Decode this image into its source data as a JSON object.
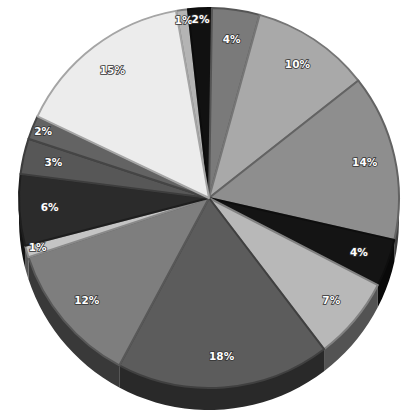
{
  "chart_data": {
    "type": "pie",
    "title": "",
    "style": "3d-tilted-grayscale",
    "start_angle_deg_clockwise_from_top": -10,
    "slices": [
      {
        "label": "1%",
        "value": 1,
        "color": "#b4b4b4"
      },
      {
        "label": "2%",
        "value": 2,
        "color": "#111111"
      },
      {
        "label": "4%",
        "value": 4,
        "color": "#7a7a7a"
      },
      {
        "label": "10%",
        "value": 10,
        "color": "#a9a9a9"
      },
      {
        "label": "14%",
        "value": 14,
        "color": "#8e8e8e"
      },
      {
        "label": "4%",
        "value": 4,
        "color": "#141414"
      },
      {
        "label": "7%",
        "value": 7,
        "color": "#b8b8b8"
      },
      {
        "label": "18%",
        "value": 18,
        "color": "#5c5c5c"
      },
      {
        "label": "12%",
        "value": 12,
        "color": "#7e7e7e"
      },
      {
        "label": "1%",
        "value": 1,
        "color": "#c4c4c4"
      },
      {
        "label": "6%",
        "value": 6,
        "color": "#2b2b2b"
      },
      {
        "label": "3%",
        "value": 3,
        "color": "#575757"
      },
      {
        "label": "2%",
        "value": 2,
        "color": "#636363"
      },
      {
        "label": "15%",
        "value": 15,
        "color": "#ececec"
      }
    ],
    "legend": "none",
    "labels_inside_slices": true
  }
}
